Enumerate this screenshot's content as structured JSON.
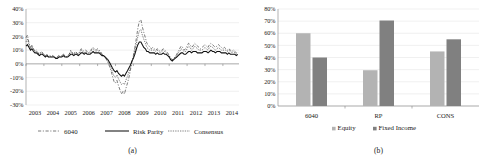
{
  "figure": {
    "panel_a_caption": "(a)",
    "panel_b_caption": "(b)"
  },
  "chart_data": [
    {
      "id": "panel-a",
      "type": "line",
      "title": "",
      "subtitle": "",
      "xlabel": "",
      "ylabel": "",
      "grid": true,
      "legend_position": "bottom",
      "xlim": [
        2003,
        2014.9
      ],
      "ylim": [
        -0.3,
        0.4
      ],
      "ytick_labels": [
        "40%",
        "30%",
        "20%",
        "10%",
        "0%",
        "-10%",
        "-20%",
        "-30%"
      ],
      "ytick_values": [
        0.4,
        0.3,
        0.2,
        0.1,
        0.0,
        -0.1,
        -0.2,
        -0.3
      ],
      "xtick_labels": [
        "2003",
        "2004",
        "2005",
        "2006",
        "2007",
        "2008",
        "2009",
        "2010",
        "2011",
        "2012",
        "2013",
        "2014"
      ],
      "xtick_values": [
        2003,
        2004,
        2005,
        2006,
        2007,
        2008,
        2009,
        2010,
        2011,
        2012,
        2013,
        2014
      ],
      "x": [
        2003.0,
        2003.08,
        2003.17,
        2003.25,
        2003.33,
        2003.42,
        2003.5,
        2003.58,
        2003.67,
        2003.75,
        2003.83,
        2003.92,
        2004.0,
        2004.08,
        2004.17,
        2004.25,
        2004.33,
        2004.42,
        2004.5,
        2004.58,
        2004.67,
        2004.75,
        2004.83,
        2004.92,
        2005.0,
        2005.08,
        2005.17,
        2005.25,
        2005.33,
        2005.42,
        2005.5,
        2005.58,
        2005.67,
        2005.75,
        2005.83,
        2005.92,
        2006.0,
        2006.08,
        2006.17,
        2006.25,
        2006.33,
        2006.42,
        2006.5,
        2006.58,
        2006.67,
        2006.75,
        2006.83,
        2006.92,
        2007.0,
        2007.08,
        2007.17,
        2007.25,
        2007.33,
        2007.42,
        2007.5,
        2007.58,
        2007.67,
        2007.75,
        2007.83,
        2007.92,
        2008.0,
        2008.08,
        2008.17,
        2008.25,
        2008.33,
        2008.42,
        2008.5,
        2008.58,
        2008.67,
        2008.75,
        2008.83,
        2008.92,
        2009.0,
        2009.08,
        2009.17,
        2009.25,
        2009.33,
        2009.42,
        2009.5,
        2009.58,
        2009.67,
        2009.75,
        2009.83,
        2009.92,
        2010.0,
        2010.08,
        2010.17,
        2010.25,
        2010.33,
        2010.42,
        2010.5,
        2010.58,
        2010.67,
        2010.75,
        2010.83,
        2010.92,
        2011.0,
        2011.08,
        2011.17,
        2011.25,
        2011.33,
        2011.42,
        2011.5,
        2011.58,
        2011.67,
        2011.75,
        2011.83,
        2011.92,
        2012.0,
        2012.08,
        2012.17,
        2012.25,
        2012.33,
        2012.42,
        2012.5,
        2012.58,
        2012.67,
        2012.75,
        2012.83,
        2012.92,
        2013.0,
        2013.08,
        2013.17,
        2013.25,
        2013.33,
        2013.42,
        2013.5,
        2013.58,
        2013.67,
        2013.75,
        2013.83,
        2013.92,
        2014.0,
        2014.08,
        2014.17,
        2014.25,
        2014.33,
        2014.42,
        2014.5,
        2014.58,
        2014.67,
        2014.75,
        2014.83
      ],
      "series": [
        {
          "name": "6040",
          "style": "dashed",
          "values": [
            0.19,
            0.21,
            0.15,
            0.12,
            0.14,
            0.11,
            0.09,
            0.1,
            0.08,
            0.07,
            0.09,
            0.08,
            0.07,
            0.06,
            0.07,
            0.05,
            0.06,
            0.05,
            0.06,
            0.05,
            0.04,
            0.05,
            0.06,
            0.05,
            0.06,
            0.07,
            0.06,
            0.05,
            0.06,
            0.07,
            0.1,
            0.08,
            0.07,
            0.09,
            0.08,
            0.07,
            0.09,
            0.11,
            0.1,
            0.09,
            0.1,
            0.09,
            0.08,
            0.09,
            0.11,
            0.12,
            0.11,
            0.1,
            0.11,
            0.1,
            0.09,
            0.07,
            0.06,
            0.05,
            0.03,
            0.01,
            -0.02,
            -0.05,
            -0.09,
            -0.13,
            -0.14,
            -0.12,
            -0.16,
            -0.19,
            -0.22,
            -0.2,
            -0.22,
            -0.18,
            -0.14,
            -0.1,
            -0.05,
            0.02,
            0.06,
            0.12,
            0.19,
            0.26,
            0.31,
            0.32,
            0.27,
            0.23,
            0.19,
            0.15,
            0.14,
            0.12,
            0.11,
            0.12,
            0.11,
            0.1,
            0.11,
            0.1,
            0.09,
            0.1,
            0.11,
            0.1,
            0.09,
            0.08,
            0.06,
            0.04,
            0.03,
            0.04,
            0.05,
            0.07,
            0.09,
            0.11,
            0.13,
            0.12,
            0.1,
            0.11,
            0.13,
            0.15,
            0.14,
            0.12,
            0.13,
            0.15,
            0.14,
            0.13,
            0.12,
            0.11,
            0.12,
            0.13,
            0.14,
            0.13,
            0.12,
            0.14,
            0.15,
            0.14,
            0.13,
            0.12,
            0.13,
            0.14,
            0.13,
            0.12,
            0.11,
            0.12,
            0.11,
            0.1,
            0.11,
            0.1,
            0.09,
            0.1,
            0.09,
            0.08,
            0.09
          ]
        },
        {
          "name": "Risk Parity",
          "style": "solid",
          "values": [
            0.13,
            0.14,
            0.12,
            0.1,
            0.11,
            0.09,
            0.08,
            0.08,
            0.07,
            0.06,
            0.07,
            0.07,
            0.06,
            0.05,
            0.06,
            0.05,
            0.05,
            0.05,
            0.05,
            0.05,
            0.04,
            0.04,
            0.05,
            0.05,
            0.05,
            0.06,
            0.05,
            0.05,
            0.05,
            0.06,
            0.07,
            0.07,
            0.06,
            0.07,
            0.07,
            0.06,
            0.07,
            0.08,
            0.08,
            0.07,
            0.08,
            0.07,
            0.07,
            0.07,
            0.08,
            0.09,
            0.08,
            0.08,
            0.08,
            0.08,
            0.07,
            0.06,
            0.06,
            0.05,
            0.04,
            0.03,
            0.01,
            -0.01,
            -0.03,
            -0.05,
            -0.06,
            -0.05,
            -0.07,
            -0.08,
            -0.09,
            -0.08,
            -0.09,
            -0.07,
            -0.05,
            -0.03,
            -0.01,
            0.02,
            0.04,
            0.07,
            0.11,
            0.14,
            0.16,
            0.16,
            0.14,
            0.12,
            0.11,
            0.09,
            0.09,
            0.08,
            0.08,
            0.08,
            0.08,
            0.07,
            0.08,
            0.07,
            0.07,
            0.07,
            0.08,
            0.07,
            0.07,
            0.06,
            0.05,
            0.03,
            0.02,
            0.03,
            0.04,
            0.05,
            0.06,
            0.07,
            0.08,
            0.08,
            0.07,
            0.07,
            0.08,
            0.09,
            0.09,
            0.08,
            0.09,
            0.09,
            0.09,
            0.08,
            0.08,
            0.08,
            0.08,
            0.09,
            0.09,
            0.09,
            0.08,
            0.09,
            0.1,
            0.09,
            0.09,
            0.08,
            0.09,
            0.09,
            0.09,
            0.08,
            0.08,
            0.08,
            0.08,
            0.07,
            0.08,
            0.07,
            0.07,
            0.07,
            0.07,
            0.06,
            0.07
          ]
        },
        {
          "name": "Consensus",
          "style": "dotted",
          "values": [
            0.16,
            0.18,
            0.14,
            0.11,
            0.13,
            0.1,
            0.09,
            0.09,
            0.08,
            0.07,
            0.08,
            0.08,
            0.07,
            0.06,
            0.07,
            0.05,
            0.06,
            0.05,
            0.06,
            0.05,
            0.04,
            0.05,
            0.06,
            0.05,
            0.06,
            0.07,
            0.06,
            0.05,
            0.06,
            0.07,
            0.09,
            0.08,
            0.07,
            0.08,
            0.08,
            0.07,
            0.08,
            0.1,
            0.09,
            0.08,
            0.09,
            0.08,
            0.08,
            0.08,
            0.1,
            0.11,
            0.1,
            0.09,
            0.1,
            0.09,
            0.08,
            0.07,
            0.06,
            0.05,
            0.03,
            0.02,
            -0.01,
            -0.03,
            -0.06,
            -0.09,
            -0.1,
            -0.08,
            -0.11,
            -0.13,
            -0.15,
            -0.14,
            -0.15,
            -0.12,
            -0.09,
            -0.06,
            -0.03,
            0.02,
            0.05,
            0.1,
            0.15,
            0.2,
            0.24,
            0.25,
            0.21,
            0.18,
            0.15,
            0.12,
            0.11,
            0.1,
            0.1,
            0.1,
            0.1,
            0.09,
            0.1,
            0.09,
            0.08,
            0.09,
            0.1,
            0.09,
            0.08,
            0.07,
            0.06,
            0.04,
            0.03,
            0.04,
            0.05,
            0.06,
            0.08,
            0.09,
            0.11,
            0.1,
            0.09,
            0.09,
            0.11,
            0.13,
            0.12,
            0.1,
            0.11,
            0.13,
            0.12,
            0.11,
            0.1,
            0.1,
            0.1,
            0.11,
            0.12,
            0.11,
            0.1,
            0.12,
            0.13,
            0.12,
            0.11,
            0.1,
            0.11,
            0.12,
            0.11,
            0.1,
            0.1,
            0.1,
            0.1,
            0.09,
            0.1,
            0.09,
            0.08,
            0.09,
            0.08,
            0.07,
            0.08
          ]
        }
      ],
      "legend": [
        {
          "label": "6040",
          "style": "dashed"
        },
        {
          "label": "Risk Parity",
          "style": "solid"
        },
        {
          "label": "Consensus",
          "style": "dotted"
        }
      ]
    },
    {
      "id": "panel-b",
      "type": "bar",
      "title": "",
      "xlabel": "",
      "ylabel": "",
      "grid": true,
      "legend_position": "bottom",
      "ylim": [
        0,
        0.8
      ],
      "ytick_labels": [
        "80%",
        "70%",
        "60%",
        "50%",
        "40%",
        "30%",
        "20%",
        "10%",
        "0%"
      ],
      "ytick_values": [
        0.8,
        0.7,
        0.6,
        0.5,
        0.4,
        0.3,
        0.2,
        0.1,
        0.0
      ],
      "categories": [
        "6040",
        "RP",
        "CONS"
      ],
      "series": [
        {
          "name": "Equity",
          "color": "#b3b3b3",
          "values": [
            0.6,
            0.295,
            0.45
          ]
        },
        {
          "name": "Fixed Income",
          "color": "#808080",
          "values": [
            0.4,
            0.705,
            0.55
          ]
        }
      ],
      "legend": [
        {
          "label": "Equity",
          "color": "#b3b3b3"
        },
        {
          "label": "Fixed Income",
          "color": "#808080"
        }
      ]
    }
  ]
}
